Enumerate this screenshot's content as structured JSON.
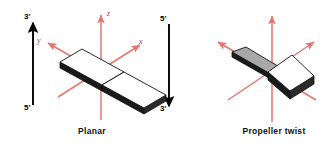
{
  "figure": {
    "background_color": "#ffffff",
    "width": 336,
    "height": 152
  },
  "colors": {
    "axis_red": "#e8746e",
    "axis_red_dark": "#d9534f",
    "strand_black": "#000000",
    "slab_white": "#ffffff",
    "slab_gray": "#a8a8a8",
    "slab_edge_dark": "#1a1a1a",
    "outline": "#111111",
    "caption_text": "#111111",
    "axis_label_text": "#b03a3a"
  },
  "panels": [
    {
      "id": "planar",
      "caption": "Planar",
      "axes": {
        "labels": {
          "x": "x",
          "y": "y",
          "z": "z"
        },
        "show_labels": true
      },
      "strands": [
        {
          "name": "left-strand",
          "direction": "up",
          "top_label": "3'",
          "bottom_label": "5'"
        },
        {
          "name": "right-strand",
          "direction": "down",
          "top_label": "5'",
          "bottom_label": "3'"
        }
      ],
      "bases": [
        {
          "name": "base-left",
          "face_color": "#ffffff",
          "tilt": "coplanar"
        },
        {
          "name": "base-right",
          "face_color": "#ffffff",
          "tilt": "coplanar"
        }
      ]
    },
    {
      "id": "propeller-twist",
      "caption": "Propeller twist",
      "axes": {
        "labels": {
          "x": "",
          "y": "",
          "z": ""
        },
        "show_labels": false
      },
      "strands": [],
      "bases": [
        {
          "name": "base-left",
          "face_color": "#a8a8a8",
          "tilt": "rotated-down"
        },
        {
          "name": "base-right",
          "face_color": "#ffffff",
          "tilt": "rotated-up"
        }
      ]
    }
  ]
}
